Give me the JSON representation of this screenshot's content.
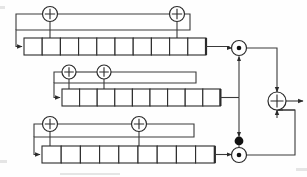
{
  "figure": {
    "name": "geffe-generator-diagram",
    "type": "block-diagram",
    "title": "",
    "background_color": "#fefefe",
    "line_color": "#2b2b2b",
    "width": 307,
    "height": 177
  },
  "legend": {
    "xor_symbol": "+",
    "and_symbol": "•",
    "not_symbol": "●"
  },
  "registers": [
    {
      "id": "lfsr-top",
      "label": "",
      "cells": 10,
      "x": 24,
      "y": 38,
      "cell_width": 18.2,
      "cell_height": 17,
      "feedback_taps": [
        2,
        9
      ],
      "xor_count": 2,
      "feedback_line_y": 14,
      "output_to": "and-gate-top"
    },
    {
      "id": "lfsr-middle",
      "label": "",
      "cells": 9,
      "x": 62,
      "y": 89,
      "cell_width": 17.6,
      "cell_height": 17,
      "feedback_taps": [
        1,
        3
      ],
      "xor_count": 2,
      "feedback_line_y": 72,
      "output_to": "branch-node"
    },
    {
      "id": "lfsr-bottom",
      "label": "",
      "cells": 9,
      "x": 42,
      "y": 146,
      "cell_width": 19.2,
      "cell_height": 17,
      "feedback_taps": [
        1,
        6
      ],
      "xor_count": 2,
      "feedback_line_y": 124,
      "output_to": "and-gate-bottom"
    }
  ],
  "gates": [
    {
      "id": "xor-top-left",
      "type": "xor",
      "symbol": "+",
      "cx": 50,
      "cy": 14,
      "r": 7.5
    },
    {
      "id": "xor-top-right",
      "type": "xor",
      "symbol": "+",
      "cx": 177,
      "cy": 14,
      "r": 7.5
    },
    {
      "id": "xor-middle-left",
      "type": "xor",
      "symbol": "+",
      "cx": 69,
      "cy": 72,
      "r": 7
    },
    {
      "id": "xor-middle-right",
      "type": "xor",
      "symbol": "+",
      "cx": 104,
      "cy": 72,
      "r": 7
    },
    {
      "id": "xor-bottom-left",
      "type": "xor",
      "symbol": "+",
      "cx": 50,
      "cy": 124,
      "r": 7.5
    },
    {
      "id": "xor-bottom-right",
      "type": "xor",
      "symbol": "+",
      "cx": 139,
      "cy": 124,
      "r": 7.5
    },
    {
      "id": "and-gate-top",
      "type": "and",
      "symbol": "•",
      "cx": 239,
      "cy": 48,
      "r": 7.5
    },
    {
      "id": "and-gate-bottom",
      "type": "and",
      "symbol": "•",
      "cx": 239,
      "cy": 155,
      "r": 7.5
    },
    {
      "id": "xor-output",
      "type": "xor",
      "symbol": "+",
      "cx": 277,
      "cy": 101,
      "r": 9
    }
  ],
  "nodes": [
    {
      "id": "not-bubble",
      "type": "inverter",
      "cx": 239,
      "cy": 141,
      "r": 4.4,
      "filled": true
    },
    {
      "id": "branch-node",
      "type": "junction",
      "cx": 239,
      "cy": 101
    }
  ],
  "output": {
    "id": "keystream-output",
    "label": "",
    "x": 299,
    "y": 101,
    "direction": "right"
  }
}
